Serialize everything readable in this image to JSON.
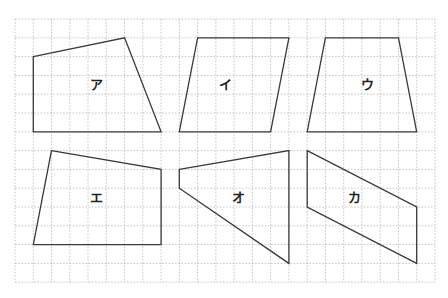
{
  "grid": {
    "origin_x": 15,
    "origin_y": 19,
    "cell_w": 18.26,
    "cell_h": 18.8,
    "cols": 23,
    "rows": 14,
    "line_color": "#b8b8b8",
    "style": "dashed"
  },
  "shape_color": "#3a3a3a",
  "shapes": [
    {
      "label": "ア",
      "points": [
        [
          1,
          2
        ],
        [
          6,
          1
        ],
        [
          8,
          6
        ],
        [
          1,
          6
        ]
      ],
      "label_pos": [
        96,
        84
      ]
    },
    {
      "label": "イ",
      "points": [
        [
          10,
          1
        ],
        [
          15,
          1
        ],
        [
          14,
          6
        ],
        [
          9,
          6
        ]
      ],
      "label_pos": [
        225,
        84
      ]
    },
    {
      "label": "ウ",
      "points": [
        [
          17,
          1
        ],
        [
          21,
          1
        ],
        [
          22,
          6
        ],
        [
          16,
          6
        ]
      ],
      "label_pos": [
        367,
        84
      ]
    },
    {
      "label": "エ",
      "points": [
        [
          2,
          7
        ],
        [
          8,
          8
        ],
        [
          8,
          12
        ],
        [
          1,
          12
        ]
      ],
      "label_pos": [
        96,
        197
      ]
    },
    {
      "label": "オ",
      "points": [
        [
          9,
          8
        ],
        [
          15,
          7
        ],
        [
          15,
          13
        ],
        [
          9,
          9
        ]
      ],
      "label_pos": [
        238,
        197
      ]
    },
    {
      "label": "カ",
      "points": [
        [
          16,
          7
        ],
        [
          22,
          10
        ],
        [
          22,
          13
        ],
        [
          16,
          10
        ]
      ],
      "label_pos": [
        354,
        197
      ]
    }
  ]
}
